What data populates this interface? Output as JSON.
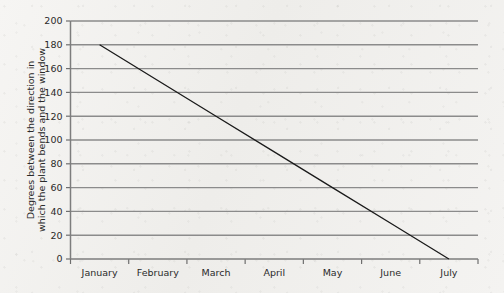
{
  "chart_data": {
    "type": "line",
    "title": "",
    "xlabel": "",
    "ylabel_line1": "Degrees between the direction in",
    "ylabel_line2": "which the plant bends and the window",
    "categories": [
      "January",
      "February",
      "March",
      "April",
      "May",
      "June",
      "July"
    ],
    "x": [
      0.5,
      1.5,
      2.5,
      3.5,
      4.5,
      5.5,
      6.5
    ],
    "series": [
      {
        "name": "Plant bend angle",
        "values": [
          180,
          150,
          120,
          90,
          60,
          30,
          0
        ]
      }
    ],
    "y_ticks": [
      0,
      20,
      40,
      60,
      80,
      100,
      120,
      140,
      160,
      180,
      200
    ],
    "y_tick_labels": [
      "0",
      "20",
      "40",
      "60",
      "80",
      "100",
      "120",
      "140",
      "160",
      "180",
      "200"
    ],
    "ylim": [
      0,
      200
    ],
    "xlim": [
      0,
      7
    ],
    "grid": true,
    "grid_axis": "y",
    "legend": false,
    "legend_position": "none",
    "line_start_value": 180,
    "line_end_value": 0,
    "colors": {
      "line": "#1a1a1a",
      "gridline": "#8b8b8b",
      "axis": "#7d7d7d",
      "text": "#2a2a2a",
      "background": "#f3f2f0"
    }
  }
}
